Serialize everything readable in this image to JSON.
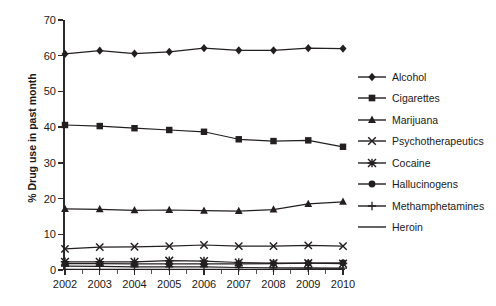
{
  "chart_data": {
    "type": "line",
    "title": "",
    "xlabel": "",
    "ylabel": "% Drug use in past month",
    "categories": [
      "2002",
      "2003",
      "2004",
      "2005",
      "2006",
      "2007",
      "2008",
      "2009",
      "2010"
    ],
    "x": [
      2002,
      2003,
      2004,
      2005,
      2006,
      2007,
      2008,
      2009,
      2010
    ],
    "xlim": [
      2002,
      2010
    ],
    "ylim": [
      0,
      70
    ],
    "yticks": [
      0,
      10,
      20,
      30,
      40,
      50,
      60,
      70
    ],
    "ytick_labels": [
      "0",
      "10",
      "20",
      "30",
      "40",
      "50",
      "60",
      "70"
    ],
    "grid": false,
    "legend_position": "right",
    "series": [
      {
        "name": "Alcohol",
        "marker": "diamond",
        "values": [
          60.5,
          61.4,
          60.6,
          61.1,
          62.1,
          61.5,
          61.5,
          62.1,
          62.0
        ]
      },
      {
        "name": "Cigarettes",
        "marker": "square",
        "values": [
          40.6,
          40.3,
          39.7,
          39.2,
          38.7,
          36.6,
          36.1,
          36.3,
          34.5
        ]
      },
      {
        "name": "Marijuana",
        "marker": "triangle",
        "values": [
          17.1,
          17.0,
          16.7,
          16.8,
          16.6,
          16.5,
          16.9,
          18.5,
          19.1
        ]
      },
      {
        "name": "Psychotherapeutics",
        "marker": "x",
        "values": [
          5.9,
          6.4,
          6.5,
          6.7,
          7.0,
          6.7,
          6.7,
          6.9,
          6.7
        ]
      },
      {
        "name": "Cocaine",
        "marker": "asterisk",
        "values": [
          2.3,
          2.3,
          2.3,
          2.6,
          2.5,
          2.1,
          1.9,
          1.9,
          1.8
        ]
      },
      {
        "name": "Hallucinogens",
        "marker": "circle",
        "values": [
          1.8,
          1.8,
          1.7,
          1.7,
          1.7,
          1.7,
          1.8,
          1.9,
          2.0
        ]
      },
      {
        "name": "Methamphetamines",
        "marker": "plus",
        "values": [
          1.1,
          1.0,
          0.9,
          0.9,
          0.9,
          0.7,
          0.6,
          0.6,
          0.5
        ]
      },
      {
        "name": "Heroin",
        "marker": "line",
        "values": [
          0.2,
          0.2,
          0.2,
          0.2,
          0.2,
          0.2,
          0.2,
          0.3,
          0.3
        ]
      }
    ]
  },
  "legend": {
    "items": [
      {
        "label": "Alcohol"
      },
      {
        "label": "Cigarettes"
      },
      {
        "label": "Marijuana"
      },
      {
        "label": "Psychotherapeutics"
      },
      {
        "label": "Cocaine"
      },
      {
        "label": "Hallucinogens"
      },
      {
        "label": "Methamphetamines"
      },
      {
        "label": "Heroin"
      }
    ]
  },
  "style": {
    "line_color": "#231f20",
    "axis_color": "#2b2b2b",
    "text_color": "#1a1a1a",
    "background": "#ffffff"
  }
}
